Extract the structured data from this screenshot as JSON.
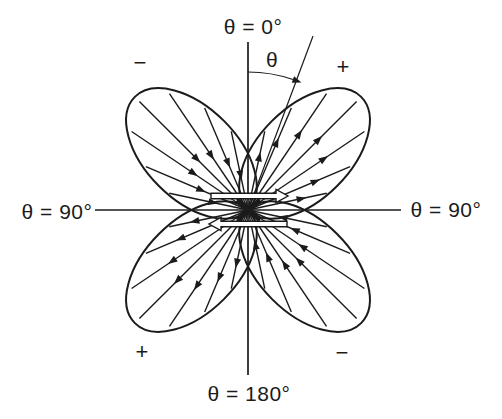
{
  "figure": {
    "background": "#ffffff",
    "ink": "#1b1b1b",
    "center": {
      "x": 248,
      "y": 210
    },
    "labels": {
      "top": "θ = 0°",
      "bottom": "θ = 180°",
      "left": "θ = 90°",
      "right": "θ = 90°",
      "angle": "θ"
    },
    "quadrant_signs": [
      {
        "quadrant": "upper-left",
        "text": "−"
      },
      {
        "quadrant": "upper-right",
        "text": "+"
      },
      {
        "quadrant": "lower-left",
        "text": "+"
      },
      {
        "quadrant": "lower-right",
        "text": "−"
      }
    ],
    "axes": {
      "vertical": {
        "x": 248,
        "y1": 42,
        "y2": 375
      },
      "horizontal": {
        "y": 210,
        "x1": 95,
        "x2": 401
      }
    },
    "theta_reference_line": {
      "x2": 313,
      "y2": 36
    },
    "angle_arc": {
      "radius": 138,
      "start_deg": 0,
      "end_deg": 19
    },
    "lobe_shape": {
      "a": 80,
      "b": 46
    },
    "ray_offsets_deg": [
      -33,
      -22,
      -11,
      0,
      11,
      22,
      33
    ],
    "lobes": [
      {
        "quadrant": "upper-right",
        "axis_deg": 45,
        "arrow_direction": "outward"
      },
      {
        "quadrant": "lower-right",
        "axis_deg": 135,
        "arrow_direction": "inward"
      },
      {
        "quadrant": "lower-left",
        "axis_deg": 225,
        "arrow_direction": "outward"
      },
      {
        "quadrant": "upper-left",
        "axis_deg": 315,
        "arrow_direction": "inward"
      }
    ],
    "couple_arrows": [
      {
        "name": "force-couple-arrow-right",
        "tail_x": 211,
        "tip_x": 288,
        "y": 196,
        "body_h": 5.5,
        "head_w": 13,
        "head_len": 12
      },
      {
        "name": "force-couple-arrow-left",
        "tail_x": 287,
        "tip_x": 209,
        "y": 224,
        "body_h": 5.5,
        "head_w": 13,
        "head_len": 12
      }
    ]
  }
}
